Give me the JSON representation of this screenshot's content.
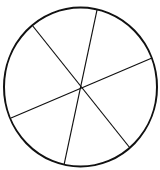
{
  "diagram": {
    "type": "circle-divided-into-sectors",
    "sector_count": 6,
    "stroke_color": "#111111",
    "background": "#ffffff",
    "circle": {
      "cx": 80.5,
      "cy": 87,
      "rx": 76.5,
      "ry": 79.5,
      "stroke_width": 2
    },
    "lines": [
      {
        "x1": 32,
        "y1": 25,
        "x2": 130,
        "y2": 148
      },
      {
        "x1": 97,
        "y1": 10,
        "x2": 64,
        "y2": 165
      },
      {
        "x1": 11,
        "y1": 118,
        "x2": 152,
        "y2": 58
      }
    ]
  }
}
